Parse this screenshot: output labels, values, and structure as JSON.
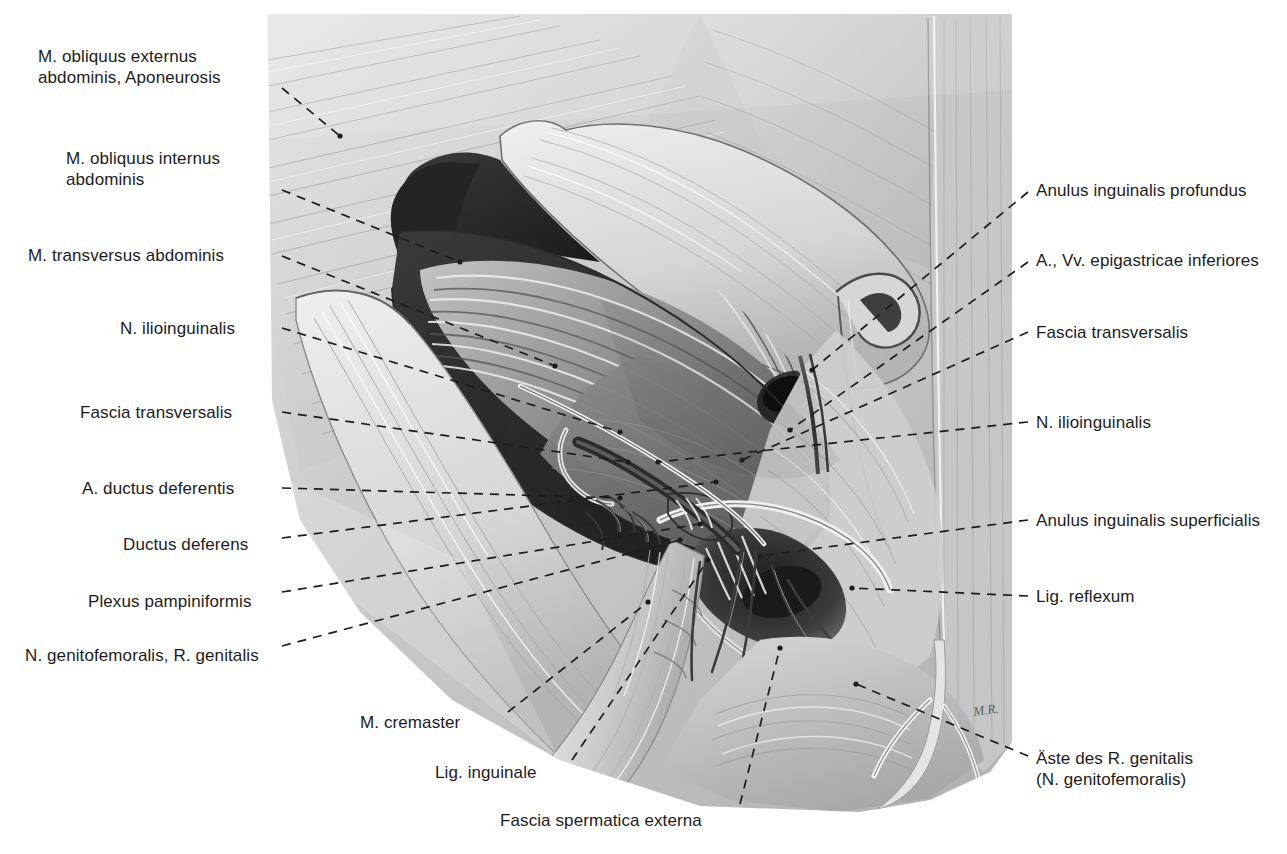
{
  "figure": {
    "type": "anatomical-illustration",
    "medium": "graphite pencil drawing, grayscale",
    "artist_signature": "M.R.",
    "palette": {
      "background": "#ffffff",
      "label_text": "#1c1c1c",
      "leader_line": "#1c1c1c",
      "tissue_light": "#e3e3e3",
      "tissue_mid": "#b9b9b9",
      "tissue_shadow": "#8a8a8a",
      "cavity_dark": "#2a2a2a",
      "cavity_deep": "#141414"
    }
  },
  "labels_left": [
    {
      "id": "obliquus-externus-aponeurosis",
      "lines": [
        "M. obliquus externus",
        "abdominis, Aponeurosis"
      ],
      "x": 38,
      "y": 46,
      "w": 232,
      "align": "left",
      "leader": [
        [
          282,
          88
        ],
        [
          340,
          136
        ]
      ],
      "dot": [
        340,
        136
      ],
      "dash": true
    },
    {
      "id": "obliquus-internus",
      "lines": [
        "M. obliquus internus",
        "abdominis"
      ],
      "x": 66,
      "y": 148,
      "w": 204,
      "align": "left",
      "leader": [
        [
          282,
          190
        ],
        [
          460,
          262
        ]
      ],
      "dot": [
        460,
        262
      ],
      "dash": true
    },
    {
      "id": "transversus-abdominis",
      "lines": [
        "M. transversus abdominis"
      ],
      "x": 28,
      "y": 245,
      "w": 242,
      "align": "left",
      "leader": [
        [
          282,
          256
        ],
        [
          555,
          366
        ]
      ],
      "dot": [
        555,
        366
      ],
      "dash": true
    },
    {
      "id": "n-ilioinguinalis-left",
      "lines": [
        "N. ilioinguinalis"
      ],
      "x": 120,
      "y": 318,
      "w": 150,
      "align": "left",
      "leader": [
        [
          282,
          328
        ],
        [
          620,
          432
        ]
      ],
      "dot": [
        620,
        432
      ],
      "dash": true
    },
    {
      "id": "fascia-transversalis-left",
      "lines": [
        "Fascia transversalis"
      ],
      "x": 80,
      "y": 402,
      "w": 190,
      "align": "left",
      "leader": [
        [
          282,
          412
        ],
        [
          628,
          462
        ]
      ],
      "dot": [
        628,
        462
      ],
      "dash": true
    },
    {
      "id": "a-ductus-deferentis",
      "lines": [
        "A. ductus deferentis"
      ],
      "x": 82,
      "y": 478,
      "w": 188,
      "align": "left",
      "leader": [
        [
          282,
          488
        ],
        [
          620,
          498
        ]
      ],
      "dot": [
        620,
        498
      ],
      "dash": true
    },
    {
      "id": "ductus-deferens",
      "lines": [
        "Ductus deferens"
      ],
      "x": 123,
      "y": 534,
      "w": 147,
      "align": "left",
      "leader": [
        [
          282,
          538
        ],
        [
          716,
          482
        ]
      ],
      "dot": [
        716,
        482
      ],
      "dash": true
    },
    {
      "id": "plexus-pampiniformis",
      "lines": [
        "Plexus pampiniformis"
      ],
      "x": 88,
      "y": 591,
      "w": 182,
      "align": "left",
      "leader": [
        [
          282,
          592
        ],
        [
          700,
          524
        ]
      ],
      "dot": [
        700,
        524
      ],
      "dash": true
    },
    {
      "id": "n-genitofemoralis-r-genitalis",
      "lines": [
        "N. genitofemoralis, R. genitalis"
      ],
      "x": 25,
      "y": 645,
      "w": 245,
      "align": "left",
      "leader": [
        [
          282,
          646
        ],
        [
          680,
          540
        ]
      ],
      "dot": [
        680,
        540
      ],
      "dash": true
    }
  ],
  "labels_bottom": [
    {
      "id": "m-cremaster",
      "lines": [
        "M. cremaster"
      ],
      "x": 360,
      "y": 712,
      "w": 140,
      "align": "left",
      "leader": [
        [
          508,
          712
        ],
        [
          648,
          602
        ]
      ],
      "dot": [
        648,
        602
      ],
      "dash": true
    },
    {
      "id": "lig-inguinale",
      "lines": [
        "Lig. inguinale"
      ],
      "x": 435,
      "y": 762,
      "w": 130,
      "align": "left",
      "leader": [
        [
          572,
          760
        ],
        [
          708,
          560
        ]
      ],
      "dot": [
        708,
        560
      ],
      "dash": true
    },
    {
      "id": "fascia-spermatica-externa",
      "lines": [
        "Fascia spermatica externa"
      ],
      "x": 500,
      "y": 810,
      "w": 232,
      "align": "left",
      "leader": [
        [
          740,
          804
        ],
        [
          780,
          648
        ]
      ],
      "dot": [
        780,
        648
      ],
      "dash": true
    }
  ],
  "labels_right": [
    {
      "id": "anulus-inguinalis-profundus",
      "lines": [
        "Anulus inguinalis profundus"
      ],
      "x": 1036,
      "y": 180,
      "w": 245,
      "align": "left",
      "leader": [
        [
          1028,
          192
        ],
        [
          812,
          370
        ]
      ],
      "dot": [
        812,
        370
      ],
      "dash": true
    },
    {
      "id": "a-vv-epigastricae-inferiores",
      "lines": [
        "A., Vv. epigastricae inferiores"
      ],
      "x": 1036,
      "y": 250,
      "w": 250,
      "align": "left",
      "leader": [
        [
          1028,
          262
        ],
        [
          790,
          430
        ]
      ],
      "dot": [
        790,
        430
      ],
      "dash": true
    },
    {
      "id": "fascia-transversalis-right",
      "lines": [
        "Fascia transversalis"
      ],
      "x": 1036,
      "y": 322,
      "w": 196,
      "align": "left",
      "leader": [
        [
          1028,
          332
        ],
        [
          742,
          460
        ]
      ],
      "dot": [
        742,
        460
      ],
      "dash": true
    },
    {
      "id": "n-ilioinguinalis-right",
      "lines": [
        "N. ilioinguinalis"
      ],
      "x": 1036,
      "y": 412,
      "w": 150,
      "align": "left",
      "leader": [
        [
          1028,
          422
        ],
        [
          658,
          462
        ]
      ],
      "dot": [
        658,
        462
      ],
      "dash": true
    },
    {
      "id": "anulus-inguinalis-superficialis",
      "lines": [
        "Anulus inguinalis superficialis"
      ],
      "x": 1036,
      "y": 510,
      "w": 250,
      "align": "left",
      "leader": [
        [
          1028,
          520
        ],
        [
          760,
          556
        ]
      ],
      "dot": [
        760,
        556
      ],
      "dash": true
    },
    {
      "id": "lig-reflexum",
      "lines": [
        "Lig. reflexum"
      ],
      "x": 1036,
      "y": 586,
      "w": 140,
      "align": "left",
      "leader": [
        [
          1028,
          596
        ],
        [
          852,
          588
        ]
      ],
      "dot": [
        852,
        588
      ],
      "dash": true
    },
    {
      "id": "aeste-des-r-genitalis",
      "lines": [
        "Äste des R. genitalis",
        "(N. genitofemoralis)"
      ],
      "x": 1036,
      "y": 748,
      "w": 195,
      "align": "left",
      "leader": [
        [
          1028,
          756
        ],
        [
          856,
          684
        ]
      ],
      "dot": [
        856,
        684
      ],
      "dash": true
    }
  ],
  "structures": {
    "aponeurosis_externus": "M. obliquus externus abdominis, Aponeurosis",
    "internus": "M. obliquus internus abdominis",
    "transversus": "M. transversus abdominis",
    "cremaster": "M. cremaster",
    "inguinal_ligament": "Lig. inguinale",
    "deep_ring": "Anulus inguinalis profundus",
    "superficial_ring": "Anulus inguinalis superficialis"
  }
}
